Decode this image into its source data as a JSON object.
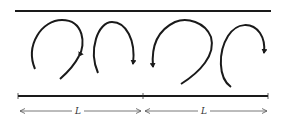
{
  "diagram": {
    "colors": {
      "stroke": "#1a1a1a",
      "dim": "#555555",
      "background": "#ffffff"
    },
    "walls": {
      "top": "upper-wall",
      "bottom": "lower-wall"
    },
    "vortices": [
      {
        "id": 1,
        "direction": "clockwise"
      },
      {
        "id": 2,
        "direction": "clockwise"
      },
      {
        "id": 3,
        "direction": "counterclockwise"
      },
      {
        "id": 4,
        "direction": "clockwise"
      }
    ],
    "dimensions": [
      {
        "label": "L"
      },
      {
        "label": "L"
      }
    ]
  }
}
